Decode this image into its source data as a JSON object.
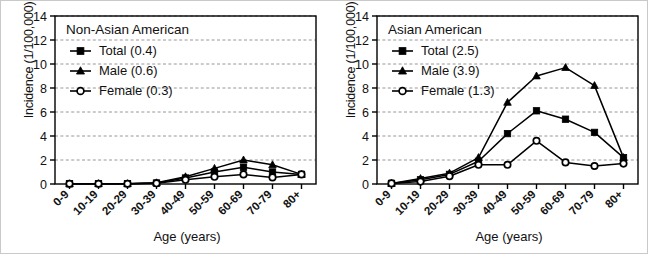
{
  "figure": {
    "panel_count": 2,
    "axis": {
      "ylabel": "Incidence (1/100,000)",
      "xlabel": "Age (years)",
      "yticks": [
        "0",
        "2",
        "4",
        "6",
        "8",
        "10",
        "12",
        "14"
      ],
      "xticks": [
        "0-9",
        "10-19",
        "20-29",
        "30-39",
        "40-49",
        "50-59",
        "60-69",
        "70-79",
        "80+"
      ]
    },
    "marker_names": {
      "total": "filled-square-marker",
      "male": "filled-triangle-marker",
      "female": "open-circle-marker"
    },
    "colors": {
      "line": "#000000",
      "grid": "#8c8c8c",
      "axis": "#000000",
      "background": "#ffffff",
      "frame": "#c9c9c9"
    }
  },
  "chart_data": [
    {
      "type": "line",
      "title": "Non-Asian American",
      "xlabel": "Age (years)",
      "ylabel": "Incidence (1/100,000)",
      "ylim": [
        0,
        14
      ],
      "yticks": [
        0,
        2,
        4,
        6,
        8,
        10,
        12,
        14
      ],
      "grid": "horizontal-dashed",
      "legend_position": "top-left-inside",
      "categories": [
        "0-9",
        "10-19",
        "20-29",
        "30-39",
        "40-49",
        "50-59",
        "60-69",
        "70-79",
        "80+"
      ],
      "series": [
        {
          "name": "Total (0.4)",
          "label": "Total",
          "overall_rate": 0.4,
          "marker": "filled-square",
          "values": [
            0.02,
            0.03,
            0.03,
            0.08,
            0.5,
            1.0,
            1.4,
            1.0,
            0.8
          ]
        },
        {
          "name": "Male  (0.6)",
          "label": "Male",
          "overall_rate": 0.6,
          "marker": "filled-triangle",
          "values": [
            0.02,
            0.03,
            0.03,
            0.1,
            0.6,
            1.3,
            2.0,
            1.6,
            0.8
          ]
        },
        {
          "name": "Female (0.3)",
          "label": "Female",
          "overall_rate": 0.3,
          "marker": "open-circle",
          "values": [
            0.02,
            0.02,
            0.02,
            0.06,
            0.35,
            0.6,
            0.8,
            0.55,
            0.8
          ]
        }
      ]
    },
    {
      "type": "line",
      "title": "Asian American",
      "xlabel": "Age (years)",
      "ylabel": "Incidence (1/100,000)",
      "ylim": [
        0,
        14
      ],
      "yticks": [
        0,
        2,
        4,
        6,
        8,
        10,
        12,
        14
      ],
      "grid": "horizontal-dashed",
      "legend_position": "top-left-inside",
      "categories": [
        "0-9",
        "10-19",
        "20-29",
        "30-39",
        "40-49",
        "50-59",
        "60-69",
        "70-79",
        "80+"
      ],
      "series": [
        {
          "name": "Total (2.5)",
          "label": "Total",
          "overall_rate": 2.5,
          "marker": "filled-square",
          "values": [
            0.05,
            0.35,
            0.8,
            1.9,
            4.2,
            6.1,
            5.4,
            4.3,
            2.2
          ]
        },
        {
          "name": "Male (3.9)",
          "label": "Male",
          "overall_rate": 3.9,
          "marker": "filled-triangle",
          "values": [
            0.05,
            0.45,
            0.9,
            2.2,
            6.8,
            9.0,
            9.7,
            8.2,
            2.2
          ]
        },
        {
          "name": "Female (1.3)",
          "label": "Female",
          "overall_rate": 1.3,
          "marker": "open-circle",
          "values": [
            0.05,
            0.2,
            0.65,
            1.6,
            1.6,
            3.6,
            1.8,
            1.5,
            1.7
          ]
        }
      ]
    }
  ]
}
